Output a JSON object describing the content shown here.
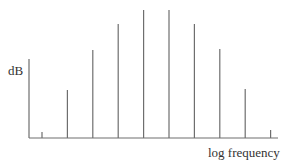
{
  "chart_data": {
    "type": "bar",
    "title": "",
    "xlabel": "log frequency",
    "ylabel": "dB",
    "categories": [
      "1",
      "2",
      "3",
      "4",
      "5",
      "6",
      "7",
      "8",
      "9",
      "10"
    ],
    "values": [
      6,
      48,
      88,
      114,
      128,
      128,
      114,
      89,
      49,
      8
    ],
    "grid": false,
    "legend": null,
    "colors": {
      "line": "#6e6e6e",
      "axis": "#6e6e6e",
      "text": "#333333"
    }
  },
  "labels": {
    "y_axis": "dB",
    "x_axis": "log frequency"
  }
}
